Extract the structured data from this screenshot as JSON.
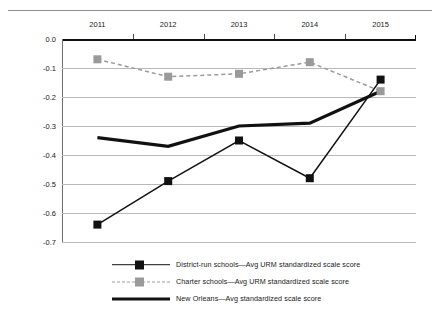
{
  "page": {
    "top_fragment": ""
  },
  "chart_data": {
    "type": "line",
    "title": "",
    "xlabel": "",
    "ylabel": "",
    "categories": [
      "2011",
      "2012",
      "2013",
      "2014",
      "2015"
    ],
    "ylim": [
      -0.7,
      0.0
    ],
    "yticks": [
      "0.0",
      "-0.1",
      "-0.2",
      "-0.3",
      "-0.4",
      "-0.5",
      "-0.6",
      "-0.7"
    ],
    "ytick_values": [
      0.0,
      -0.1,
      -0.2,
      -0.3,
      -0.4,
      -0.5,
      -0.6,
      -0.7
    ],
    "grid": true,
    "legend_position": "bottom",
    "series": [
      {
        "name": "District-run schools—Avg URM standardized scale score",
        "values": [
          -0.64,
          -0.49,
          -0.35,
          -0.48,
          -0.14
        ],
        "color": "#111111",
        "style": "solid",
        "marker": "square"
      },
      {
        "name": "Charter schools—Avg URM standardized scale score",
        "values": [
          -0.07,
          -0.13,
          -0.12,
          -0.08,
          -0.18
        ],
        "color": "#9a9a9a",
        "style": "dashed",
        "marker": "square"
      },
      {
        "name": "New Orleans—Avg standardized scale score",
        "values": [
          -0.34,
          -0.37,
          -0.3,
          -0.29,
          -0.18
        ],
        "color": "#111111",
        "style": "thick",
        "marker": "none"
      }
    ]
  }
}
